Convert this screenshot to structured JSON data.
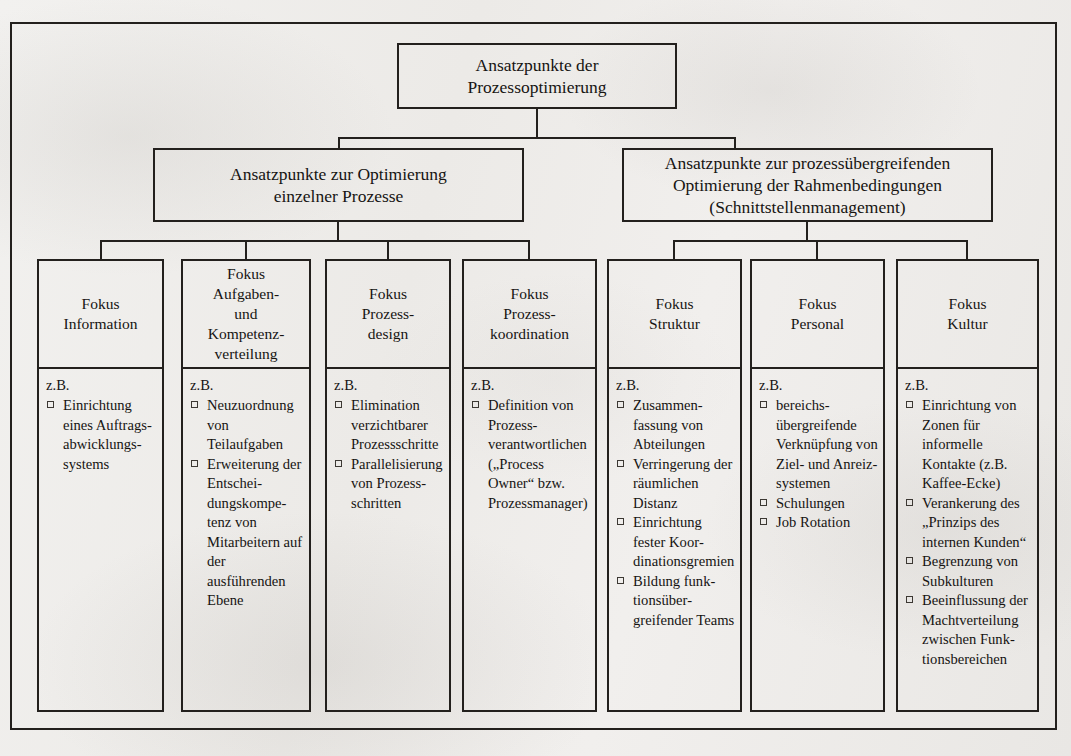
{
  "diagram": {
    "title_box": "Ansatzpunkte der\nProzessoptimierung",
    "branch_left": "Ansatzpunkte zur Optimierung\neinzelner Prozesse",
    "branch_right": "Ansatzpunkte zur prozessübergreifenden\nOptimierung der Rahmenbedingungen\n(Schnittstellenmanagement)",
    "example_label": "z.B.",
    "columns": [
      {
        "id": "information",
        "heading": "Fokus\nInformation",
        "items": [
          "Einrichtung eines Auftrags­abwicklungs­systems"
        ]
      },
      {
        "id": "aufgaben-kompetenzverteilung",
        "heading": "Fokus\nAufgaben-\nund\nKompetenz-\nverteilung",
        "items": [
          "Neuzuord­nung von Teilaufgaben",
          "Erweiterung der Entschei­dungskompe­tenz von Mitarbeitern auf der ausführenden Ebene"
        ]
      },
      {
        "id": "prozessdesign",
        "heading": "Fokus\nProzess-\ndesign",
        "items": [
          "Elimination verzichtbarer Prozess­schritte",
          "Paralleli­sierung von Prozess­schritten"
        ]
      },
      {
        "id": "prozesskoordination",
        "heading": "Fokus\nProzess-\nkoordination",
        "items": [
          "Definition von Prozess­verantwort­lichen („Process Owner“ bzw. Prozess­manager)"
        ]
      },
      {
        "id": "struktur",
        "heading": "Fokus\nStruktur",
        "items": [
          "Zusammen­fassung von Abteilungen",
          "Verringerung der räumli­chen Distanz",
          "Einrichtung fester Koor­dinations­gremien",
          "Bildung funk­tionsüber­greifender Teams"
        ]
      },
      {
        "id": "personal",
        "heading": "Fokus\nPersonal",
        "items": [
          "bereichs­übergreifen­de Verknüp­fung von Ziel- und Anreiz­systemen",
          "Schulungen",
          "Job Rotation"
        ]
      },
      {
        "id": "kultur",
        "heading": "Fokus\nKultur",
        "items": [
          "Einrichtung von Zonen für informelle Kontakte (z.B. Kaffee-Ecke)",
          "Verankerung des „Prinzips des internen Kunden“",
          "Begrenzung von Subkul­turen",
          "Beeinflussung der Machtver­teilung zwi­schen Funk­tionsbereichen"
        ]
      }
    ],
    "colors": {
      "ink": "#23201d",
      "paper": "#efeeec"
    }
  }
}
